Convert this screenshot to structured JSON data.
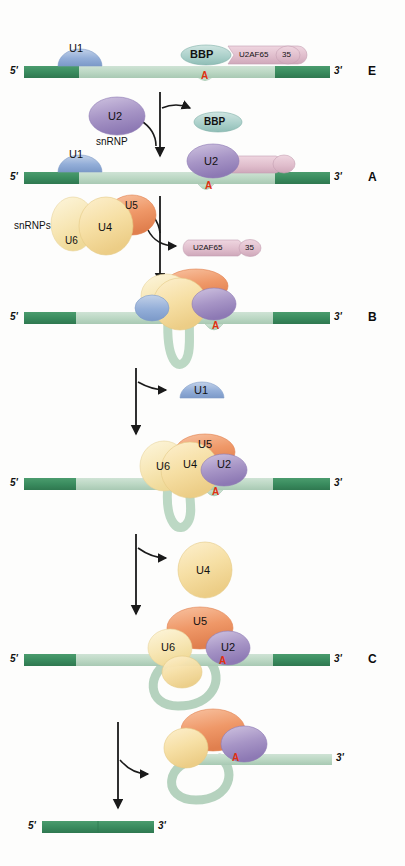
{
  "figure": {
    "type": "biological-pathway-diagram"
  },
  "colors": {
    "exon": "#3a8c5f",
    "intron": "#bcd8c4",
    "u1": "#93aed8",
    "u2": "#a795c6",
    "u4": "#f6dfa4",
    "u5": "#ef9868",
    "u6": "#f7e6b4",
    "bbp": "#a9cfc9",
    "u2af": "#dfbccb",
    "u2af35": "#d8b4c8",
    "branch_point_letter": "#e03010",
    "arrow": "#1a1a1a",
    "text": "#111111"
  },
  "labels": {
    "u1": "U1",
    "u2": "U2",
    "u4": "U4",
    "u5": "U5",
    "u6": "U6",
    "bbp": "BBP",
    "u2af65": "U2AF65",
    "u2af35": "35",
    "branch_point": "A",
    "five_prime": "5'",
    "three_prime": "3'",
    "snrnp": "snRNP",
    "snrnps": "snRNPs"
  },
  "stages": [
    {
      "letter": "E",
      "name": "complex-e",
      "components": [
        "U1",
        "BBP",
        "U2AF65",
        "35"
      ],
      "branch_point": "A",
      "five_prime": "5'",
      "three_prime": "3'"
    },
    {
      "letter": "A",
      "name": "complex-a",
      "components": [
        "U1",
        "U2",
        "U2AF65",
        "35"
      ],
      "branch_point": "A",
      "five_prime": "5'",
      "three_prime": "3'"
    },
    {
      "letter": "B",
      "name": "complex-b",
      "components": [
        "U1",
        "U2",
        "U4",
        "U5",
        "U6"
      ],
      "branch_point": "A",
      "five_prime": "5'",
      "three_prime": "3'"
    },
    {
      "letter": "",
      "name": "complex-b-act",
      "components": [
        "U2",
        "U4",
        "U5",
        "U6"
      ],
      "branch_point": "A",
      "five_prime": "5'",
      "three_prime": "3'"
    },
    {
      "letter": "C",
      "name": "complex-c",
      "components": [
        "U2",
        "U5",
        "U6"
      ],
      "branch_point": "A",
      "five_prime": "5'",
      "three_prime": "3'"
    },
    {
      "letter": "",
      "name": "lariat-release",
      "components": [
        "U2",
        "U5",
        "U6"
      ],
      "branch_point": "A",
      "three_prime": "3'"
    },
    {
      "letter": "",
      "name": "spliced-mrna",
      "components": [],
      "five_prime": "5'",
      "three_prime": "3'"
    }
  ],
  "released": [
    {
      "name": "bbp-released",
      "label": "BBP"
    },
    {
      "name": "u2af-released",
      "label_main": "U2AF65",
      "label_sub": "35"
    },
    {
      "name": "u1-released",
      "label": "U1"
    },
    {
      "name": "u4-released",
      "label": "U4"
    }
  ],
  "incoming": [
    {
      "name": "u2-snrnp-incoming",
      "label": "U2",
      "sublabel": "snRNP"
    },
    {
      "name": "u456-snrnps-incoming",
      "labels": [
        "U6",
        "U4",
        "U5"
      ],
      "sublabel": "snRNPs"
    }
  ]
}
